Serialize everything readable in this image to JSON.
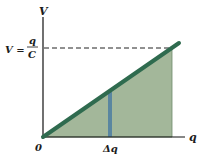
{
  "diagram": {
    "axes": {
      "y_label": "V",
      "x_label": "q",
      "origin_label": "0"
    },
    "level_label": {
      "lhs": "V =",
      "numerator": "q",
      "denominator": "C"
    },
    "strip_label": "Δq",
    "colors": {
      "shade": "#9fb394",
      "line": "#2f6b4f",
      "strip": "#5a86a0",
      "axis": "#111111"
    }
  }
}
